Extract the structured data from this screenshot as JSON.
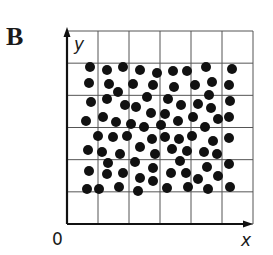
{
  "panel": {
    "label": "B"
  },
  "axes": {
    "x_label": "x",
    "y_label": "y",
    "origin_label": "0"
  },
  "grid": {
    "cols": 6,
    "rows": 6,
    "x0": 67,
    "y0": 31,
    "x1": 253,
    "y1": 224,
    "line_color": "#555555",
    "axis_color": "#111111"
  },
  "dots": {
    "radius": 5,
    "color": "#111111",
    "points": [
      [
        90,
        67
      ],
      [
        107,
        70
      ],
      [
        123,
        67
      ],
      [
        140,
        70
      ],
      [
        157,
        73
      ],
      [
        173,
        71
      ],
      [
        187,
        71
      ],
      [
        206,
        67
      ],
      [
        232,
        69
      ],
      [
        89,
        83
      ],
      [
        109,
        84
      ],
      [
        118,
        92
      ],
      [
        133,
        84
      ],
      [
        153,
        85
      ],
      [
        174,
        87
      ],
      [
        195,
        85
      ],
      [
        212,
        82
      ],
      [
        229,
        85
      ],
      [
        91,
        102
      ],
      [
        107,
        99
      ],
      [
        125,
        105
      ],
      [
        136,
        107
      ],
      [
        147,
        97
      ],
      [
        168,
        99
      ],
      [
        181,
        105
      ],
      [
        198,
        104
      ],
      [
        209,
        95
      ],
      [
        211,
        108
      ],
      [
        230,
        101
      ],
      [
        86,
        121
      ],
      [
        103,
        117
      ],
      [
        116,
        122
      ],
      [
        131,
        124
      ],
      [
        151,
        113
      ],
      [
        165,
        114
      ],
      [
        178,
        121
      ],
      [
        193,
        117
      ],
      [
        218,
        119
      ],
      [
        229,
        117
      ],
      [
        144,
        127
      ],
      [
        161,
        125
      ],
      [
        205,
        127
      ],
      [
        98,
        136
      ],
      [
        113,
        137
      ],
      [
        127,
        136
      ],
      [
        152,
        139
      ],
      [
        165,
        137
      ],
      [
        179,
        139
      ],
      [
        192,
        136
      ],
      [
        213,
        141
      ],
      [
        229,
        138
      ],
      [
        88,
        150
      ],
      [
        102,
        152
      ],
      [
        120,
        154
      ],
      [
        140,
        147
      ],
      [
        155,
        154
      ],
      [
        172,
        149
      ],
      [
        187,
        151
      ],
      [
        204,
        152
      ],
      [
        217,
        154
      ],
      [
        108,
        163
      ],
      [
        135,
        162
      ],
      [
        153,
        168
      ],
      [
        180,
        161
      ],
      [
        207,
        167
      ],
      [
        229,
        164
      ],
      [
        89,
        171
      ],
      [
        107,
        174
      ],
      [
        123,
        173
      ],
      [
        140,
        178
      ],
      [
        153,
        181
      ],
      [
        171,
        173
      ],
      [
        186,
        173
      ],
      [
        198,
        179
      ],
      [
        218,
        176
      ],
      [
        87,
        189
      ],
      [
        99,
        189
      ],
      [
        119,
        187
      ],
      [
        138,
        191
      ],
      [
        167,
        188
      ],
      [
        188,
        187
      ],
      [
        208,
        189
      ],
      [
        230,
        187
      ]
    ]
  }
}
